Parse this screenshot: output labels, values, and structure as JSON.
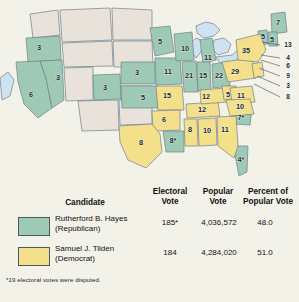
{
  "colors": {
    "hayes_green": "#9ec9b4",
    "tilden_yellow": "#f4e08a",
    "territory": "#e9e2da",
    "water": "#cfe2ef",
    "background": "#f3f2e9",
    "border": "#6f7f8c"
  },
  "map": {
    "title": "1876 presidential election electoral vote map",
    "states": [
      {
        "name": "oregon",
        "votes": "3",
        "party": "hayes",
        "x": 39,
        "y": 48
      },
      {
        "name": "california",
        "votes": "6",
        "party": "hayes",
        "x": 31,
        "y": 95
      },
      {
        "name": "nevada",
        "votes": "3",
        "party": "hayes",
        "x": 58,
        "y": 78
      },
      {
        "name": "colorado",
        "votes": "3",
        "party": "hayes",
        "x": 105,
        "y": 88
      },
      {
        "name": "nebraska",
        "votes": "3",
        "party": "hayes",
        "x": 137,
        "y": 73
      },
      {
        "name": "kansas",
        "votes": "5",
        "party": "hayes",
        "x": 143,
        "y": 98
      },
      {
        "name": "minnesota",
        "votes": "5",
        "party": "hayes",
        "x": 160,
        "y": 42
      },
      {
        "name": "iowa",
        "votes": "11",
        "party": "hayes",
        "x": 168,
        "y": 72
      },
      {
        "name": "wisconsin",
        "votes": "10",
        "party": "hayes",
        "x": 185,
        "y": 49
      },
      {
        "name": "michigan",
        "votes": "11",
        "party": "hayes",
        "x": 208,
        "y": 58
      },
      {
        "name": "illinois",
        "votes": "21",
        "party": "hayes",
        "x": 189,
        "y": 76
      },
      {
        "name": "indiana",
        "votes": "15",
        "party": "hayes",
        "x": 203,
        "y": 76
      },
      {
        "name": "ohio",
        "votes": "22",
        "party": "hayes",
        "x": 219,
        "y": 76
      },
      {
        "name": "missouri",
        "votes": "15",
        "party": "tilden",
        "x": 167,
        "y": 96
      },
      {
        "name": "arkansas",
        "votes": "6",
        "party": "tilden",
        "x": 164,
        "y": 120
      },
      {
        "name": "texas",
        "votes": "8",
        "party": "tilden",
        "x": 141,
        "y": 143
      },
      {
        "name": "louisiana",
        "votes": "8*",
        "party": "hayes",
        "x": 173,
        "y": 141
      },
      {
        "name": "mississippi",
        "votes": "8",
        "party": "tilden",
        "x": 190,
        "y": 130
      },
      {
        "name": "alabama",
        "votes": "10",
        "party": "tilden",
        "x": 207,
        "y": 131
      },
      {
        "name": "georgia",
        "votes": "11",
        "party": "tilden",
        "x": 225,
        "y": 130
      },
      {
        "name": "florida",
        "votes": "4*",
        "party": "hayes",
        "x": 241,
        "y": 160
      },
      {
        "name": "south-carolina",
        "votes": "7*",
        "party": "hayes",
        "x": 241,
        "y": 118
      },
      {
        "name": "north-carolina",
        "votes": "10",
        "party": "tilden",
        "x": 240,
        "y": 107
      },
      {
        "name": "tennessee",
        "votes": "12",
        "party": "tilden",
        "x": 202,
        "y": 110
      },
      {
        "name": "kentucky",
        "votes": "12",
        "party": "tilden",
        "x": 206,
        "y": 97
      },
      {
        "name": "west-virginia",
        "votes": "5",
        "party": "tilden",
        "x": 228,
        "y": 95
      },
      {
        "name": "virginia",
        "votes": "11",
        "party": "tilden",
        "x": 241,
        "y": 96
      },
      {
        "name": "pennsylvania",
        "votes": "29",
        "party": "tilden",
        "x": 235,
        "y": 72
      },
      {
        "name": "new-york",
        "votes": "35",
        "party": "tilden",
        "x": 246,
        "y": 51
      },
      {
        "name": "maine",
        "votes": "7",
        "party": "hayes",
        "x": 278,
        "y": 23
      },
      {
        "name": "vermont",
        "votes": "5",
        "party": "hayes",
        "x": 263,
        "y": 37
      },
      {
        "name": "new-hampshire",
        "votes": "5",
        "party": "hayes",
        "x": 272,
        "y": 40
      }
    ],
    "callouts": [
      {
        "name": "massachusetts",
        "votes": "13",
        "x": 288,
        "y": 45
      },
      {
        "name": "connecticut",
        "votes": "4",
        "x": 288,
        "y": 58
      },
      {
        "name": "rhode-island",
        "votes": "6",
        "x": 288,
        "y": 66
      },
      {
        "name": "new-jersey",
        "votes": "9",
        "x": 288,
        "y": 76
      },
      {
        "name": "delaware",
        "votes": "3",
        "x": 288,
        "y": 86
      },
      {
        "name": "maryland",
        "votes": "8",
        "x": 288,
        "y": 97
      }
    ]
  },
  "table": {
    "headers": {
      "candidate": "Candidate",
      "electoral_vote": "Electoral\nVote",
      "electoral_vote_l1": "Electoral",
      "electoral_vote_l2": "Vote",
      "popular_vote_l1": "Popular",
      "popular_vote_l2": "Vote",
      "percent_l1": "Percent of",
      "percent_l2": "Popular Vote"
    },
    "rows": [
      {
        "candidate_name": "Rutherford B. Hayes",
        "party": "(Republican)",
        "electoral_vote": "185*",
        "popular_vote": "4,036,572",
        "percent": "48.0",
        "color": "#9ec9b4"
      },
      {
        "candidate_name": "Samuel J. Tilden",
        "party": "(Democrat)",
        "electoral_vote": "184",
        "popular_vote": "4,284,020",
        "percent": "51.0",
        "color": "#f4e08a"
      }
    ],
    "footnote": "*19 electoral votes were disputed."
  }
}
